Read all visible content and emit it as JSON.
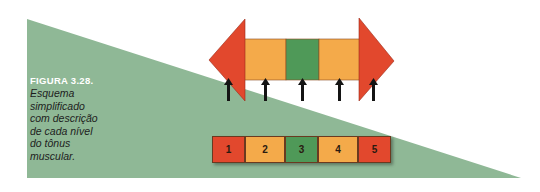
{
  "caption": {
    "title": "FIGURA 3.28.",
    "lines": [
      "Esquema",
      "simplificado",
      "com descrição",
      "de cada nível",
      "do tônus",
      "muscular."
    ]
  },
  "colors": {
    "background_triangle": "#8fb896",
    "red": "#e2482d",
    "orange": "#f4aa4a",
    "green": "#4f9958",
    "arrow": "#141414"
  },
  "diagram": {
    "double_arrow_segments": [
      "red-arrowhead-left",
      "orange",
      "green",
      "orange",
      "red-arrowhead-right"
    ],
    "pointer_arrows": 5
  },
  "scale": {
    "boxes": [
      {
        "label": "1",
        "color": "#e2482d"
      },
      {
        "label": "2",
        "color": "#f4aa4a"
      },
      {
        "label": "3",
        "color": "#4f9958"
      },
      {
        "label": "4",
        "color": "#f4aa4a"
      },
      {
        "label": "5",
        "color": "#e2482d"
      }
    ]
  }
}
